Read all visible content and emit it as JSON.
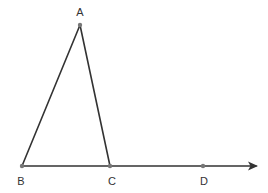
{
  "diagram": {
    "type": "geometry-triangle-with-ray",
    "stroke_color": "#333333",
    "point_color": "#777777",
    "background": "#ffffff",
    "points": {
      "A": {
        "label": "A",
        "x": 80,
        "y": 25,
        "label_x": 80,
        "label_y": 12
      },
      "B": {
        "label": "B",
        "x": 22,
        "y": 166,
        "label_x": 21,
        "label_y": 181
      },
      "C": {
        "label": "C",
        "x": 110,
        "y": 166,
        "label_x": 112,
        "label_y": 181
      },
      "D": {
        "label": "D",
        "x": 203,
        "y": 166,
        "label_x": 204,
        "label_y": 181
      }
    },
    "segments": [
      {
        "from": "A",
        "to": "B"
      },
      {
        "from": "A",
        "to": "C"
      }
    ],
    "ray": {
      "from": "B",
      "through": [
        "C",
        "D"
      ],
      "end_x": 258,
      "end_y": 166,
      "arrowhead": true
    }
  }
}
